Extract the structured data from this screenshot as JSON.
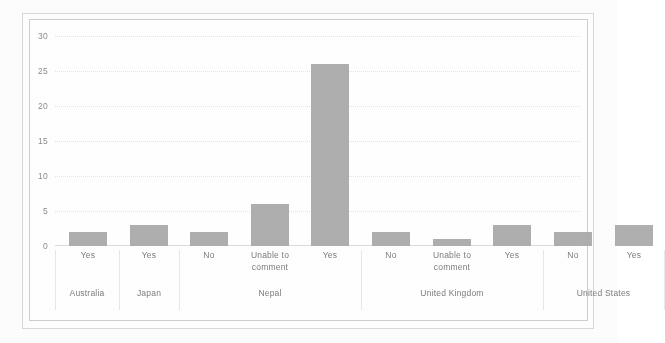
{
  "chart_data": {
    "type": "bar",
    "title": "",
    "subtitle": "",
    "xlabel": "",
    "ylabel": "",
    "ylim": [
      0,
      30
    ],
    "yticks": [
      0,
      5,
      10,
      15,
      20,
      25,
      30
    ],
    "grid": true,
    "legend": "none",
    "categories": [
      "Yes",
      "Yes",
      "No",
      "Unable to comment",
      "Yes",
      "No",
      "Unable to comment",
      "Yes",
      "No",
      "Yes"
    ],
    "values": [
      2,
      3,
      2,
      6,
      26,
      2,
      1,
      3,
      2,
      3
    ],
    "groups": [
      {
        "label": "Australia",
        "categories": [
          "Yes"
        ],
        "values": [
          2
        ]
      },
      {
        "label": "Japan",
        "categories": [
          "Yes"
        ],
        "values": [
          3
        ]
      },
      {
        "label": "Nepal",
        "categories": [
          "No",
          "Unable to comment",
          "Yes"
        ],
        "values": [
          2,
          6,
          26
        ]
      },
      {
        "label": "United Kingdom",
        "categories": [
          "No",
          "Unable to comment",
          "Yes"
        ],
        "values": [
          2,
          1,
          3
        ]
      },
      {
        "label": "United States",
        "categories": [
          "No",
          "Yes"
        ],
        "values": [
          2,
          3
        ]
      }
    ],
    "bar_color": "#a8a8a8",
    "grid_color": "#e4e4e4",
    "axis_color": "#dcdcdc",
    "text_color": "#7d7d7d"
  },
  "axis": {
    "y_tick_0": "0",
    "y_tick_5": "5",
    "y_tick_10": "10",
    "y_tick_15": "15",
    "y_tick_20": "20",
    "y_tick_25": "25",
    "y_tick_30": "30"
  },
  "cats": {
    "c0": "Yes",
    "c1": "Yes",
    "c2": "No",
    "c3": "Unable to comment",
    "c4": "Yes",
    "c5": "No",
    "c6": "Unable to comment",
    "c7": "Yes",
    "c8": "No",
    "c9": "Yes"
  },
  "groups": {
    "g0": "Australia",
    "g1": "Japan",
    "g2": "Nepal",
    "g3": "United Kingdom",
    "g4": "United States"
  }
}
